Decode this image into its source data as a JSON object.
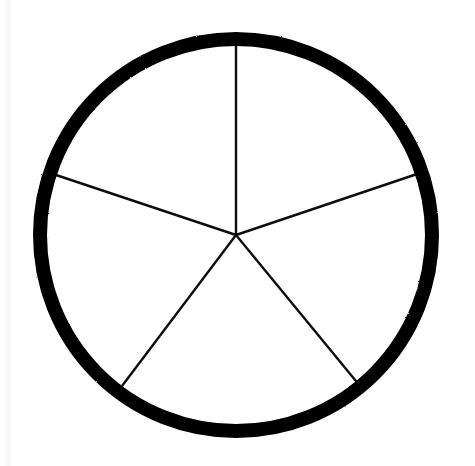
{
  "document": {
    "title": "Circle Divided Into Five Sectors",
    "background_color": "#ffffff",
    "width": 475,
    "height": 466
  },
  "chart_data": {
    "type": "pie",
    "title": "Circle Divided Into Five Sectors",
    "subtitle": "",
    "xlabel": "",
    "ylabel": "",
    "categories": [
      "Sector 1",
      "Sector 2",
      "Sector 3",
      "Sector 4",
      "Sector 5"
    ],
    "values": [
      20,
      20,
      20,
      20,
      20
    ],
    "slice_angles_deg": [
      72,
      72,
      72,
      72,
      72
    ],
    "slice_count": 5,
    "units": "percent",
    "labels_shown": false,
    "legend": {
      "show": false,
      "position": "none"
    },
    "grid": false,
    "colors": {
      "slice_fill": "#ffffff",
      "outline": "#000000",
      "divider": "#111111",
      "background": "#ffffff"
    },
    "geometry": {
      "center_x": 236,
      "center_y": 235,
      "outer_radius": 203,
      "inner_radius": 196,
      "ring_stroke_width": 14,
      "divider_stroke_width": 2.4,
      "start_angle_deg": -90,
      "rotation_deg": 0
    },
    "divider_endpoints": [
      {
        "name": "spoke-top",
        "angle_deg": -90,
        "x": 236,
        "y": 32
      },
      {
        "name": "spoke-upper-right",
        "angle_deg": -18,
        "x": 423,
        "y": 172
      },
      {
        "name": "spoke-lower-right",
        "angle_deg": 54,
        "x": 360,
        "y": 386
      },
      {
        "name": "spoke-lower-left",
        "angle_deg": 126,
        "x": 122,
        "y": 386
      },
      {
        "name": "spoke-upper-left",
        "angle_deg": 198,
        "x": 50,
        "y": 173
      }
    ],
    "annotations": []
  },
  "artifacts": {
    "left_scan_band": {
      "x": 4,
      "width": 9,
      "color": "#f4f5f7"
    }
  }
}
